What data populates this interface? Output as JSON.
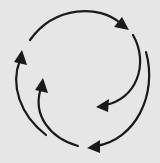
{
  "diagram": {
    "type": "cycle",
    "background_color": "#e6e6e6",
    "stroke_color": "#1a1a1a",
    "arrows": [
      {
        "id": "top-arc",
        "direction": "clockwise",
        "head": "right"
      },
      {
        "id": "right-inner-arc",
        "direction": "clockwise",
        "head": "left"
      },
      {
        "id": "right-outer-arc",
        "direction": "clockwise",
        "head": "left"
      },
      {
        "id": "left-inner-arc",
        "direction": "clockwise",
        "head": "up"
      },
      {
        "id": "left-outer-arc",
        "direction": "clockwise",
        "head": "up"
      }
    ]
  }
}
